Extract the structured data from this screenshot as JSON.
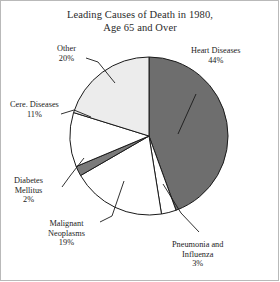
{
  "chart_data": {
    "type": "pie",
    "title": "Leading Causes of Death in 1980, Age 65 and Over",
    "title_line1": "Leading Causes of Death in 1980,",
    "title_line2": "Age 65 and Over",
    "xlabel": "",
    "ylabel": "",
    "legend": "none",
    "grid": false,
    "units": "percent",
    "start_angle_deg": 0,
    "direction": "clockwise",
    "categories": [
      "Heart Diseases",
      "Pneumonia and Influenza",
      "Malignant Neoplasms",
      "Diabetes Mellitus",
      "Cere. Diseases",
      "Other"
    ],
    "values": [
      44,
      3,
      19,
      2,
      11,
      20
    ],
    "slices": [
      {
        "label": "Heart Diseases",
        "label_line1": "Heart Diseases",
        "value": 44,
        "value_text": "44%",
        "color": "#6e6e6e"
      },
      {
        "label": "Pneumonia and Influenza",
        "label_line1": "Pneumonia and",
        "label_line2": "Influenza",
        "value": 3,
        "value_text": "3%",
        "color": "#ffffff"
      },
      {
        "label": "Malignant Neoplasms",
        "label_line1": "Malignant",
        "label_line2": "Neoplasms",
        "value": 19,
        "value_text": "19%",
        "color": "#ffffff"
      },
      {
        "label": "Diabetes Mellitus",
        "label_line1": "Diabetes",
        "label_line2": "Mellitus",
        "value": 2,
        "value_text": "2%",
        "color": "#7a7a7a"
      },
      {
        "label": "Cere. Diseases",
        "label_line1": "Cere. Diseases",
        "value": 11,
        "value_text": "11%",
        "color": "#ffffff"
      },
      {
        "label": "Other",
        "label_line1": "Other",
        "value": 20,
        "value_text": "20%",
        "color": "#ececec"
      }
    ]
  },
  "colors": {
    "heart": "#6e6e6e",
    "other": "#ececec",
    "diabetes": "#7a7a7a",
    "white_slice": "#ffffff",
    "outline": "#1a1a1a",
    "frame": "#b9b9b9",
    "text": "#1c1c1c"
  }
}
